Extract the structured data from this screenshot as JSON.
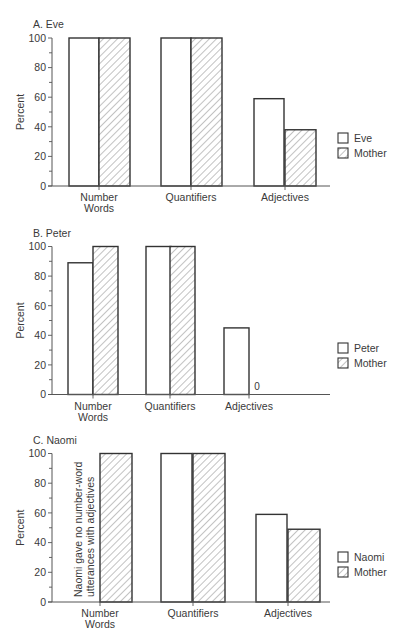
{
  "figure": {
    "y_axis_label": "Percent",
    "y_ticks": [
      0,
      20,
      40,
      60,
      80,
      100
    ],
    "categories": [
      "Number Words",
      "Quantifiers",
      "Adjectives"
    ],
    "category_label_lines": [
      [
        "Number",
        "Words"
      ],
      [
        "Quantifiers"
      ],
      [
        "Adjectives"
      ]
    ]
  },
  "chart_data": [
    {
      "type": "bar",
      "title": "A. Eve",
      "categories": [
        "Number Words",
        "Quantifiers",
        "Adjectives"
      ],
      "series": [
        {
          "name": "Eve",
          "pattern": "open",
          "values": [
            100,
            100,
            59
          ]
        },
        {
          "name": "Mother",
          "pattern": "hatched",
          "values": [
            100,
            100,
            38
          ]
        }
      ],
      "xlabel": "",
      "ylabel": "Percent",
      "ylim": [
        0,
        100
      ],
      "legend_position": "right",
      "annotations": []
    },
    {
      "type": "bar",
      "title": "B. Peter",
      "categories": [
        "Number Words",
        "Quantifiers",
        "Adjectives"
      ],
      "series": [
        {
          "name": "Peter",
          "pattern": "open",
          "values": [
            89,
            100,
            45
          ]
        },
        {
          "name": "Mother",
          "pattern": "hatched",
          "values": [
            100,
            100,
            0
          ]
        }
      ],
      "xlabel": "",
      "ylabel": "Percent",
      "ylim": [
        0,
        100
      ],
      "legend_position": "right",
      "annotations": [
        {
          "text": "0",
          "category": "Adjectives",
          "series": "Mother"
        }
      ]
    },
    {
      "type": "bar",
      "title": "C. Naomi",
      "categories": [
        "Number Words",
        "Quantifiers",
        "Adjectives"
      ],
      "series": [
        {
          "name": "Naomi",
          "pattern": "open",
          "values": [
            null,
            100,
            59
          ]
        },
        {
          "name": "Mother",
          "pattern": "hatched",
          "values": [
            100,
            100,
            49
          ]
        }
      ],
      "xlabel": "",
      "ylabel": "Percent",
      "ylim": [
        0,
        100
      ],
      "legend_position": "right",
      "annotations": [
        {
          "text": "Naomi gave no number-word utterances with adjectives",
          "lines": [
            "Naomi gave no number-word",
            "utterances with adjectives"
          ],
          "category": "Number Words",
          "series": "Naomi",
          "orientation": "vertical"
        }
      ]
    }
  ],
  "style": {
    "line_color": "#333333",
    "axis_color": "#555555",
    "hatch_color": "#777777",
    "bar_fill": "#ffffff"
  }
}
